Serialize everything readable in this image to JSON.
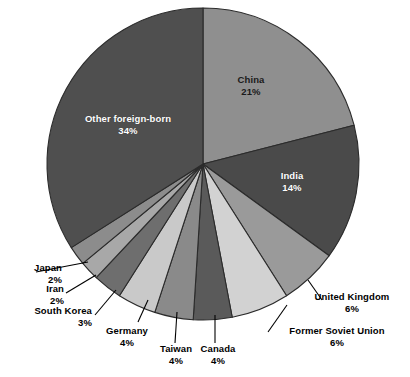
{
  "chart_data": {
    "type": "pie",
    "title": "",
    "subtitle": "",
    "xlabel": "",
    "ylabel": "",
    "legend_position": "none",
    "grid": false,
    "units": "percent",
    "total": 100,
    "start_angle_deg": 0,
    "direction": "clockwise",
    "categories": [
      "China",
      "India",
      "United Kingdom",
      "Former Soviet Union",
      "Canada",
      "Taiwan",
      "Germany",
      "South Korea",
      "Iran",
      "Japan",
      "Other foreign-born"
    ],
    "values": [
      21,
      14,
      6,
      6,
      4,
      4,
      4,
      3,
      2,
      2,
      34
    ],
    "slices": [
      {
        "name": "China",
        "value": 21,
        "pct_label": "21%",
        "color": "#8f8f8f",
        "label_placement": "inside",
        "label_color": "dark"
      },
      {
        "name": "India",
        "value": 14,
        "pct_label": "14%",
        "color": "#4a4a4a",
        "label_placement": "inside",
        "label_color": "light"
      },
      {
        "name": "United Kingdom",
        "value": 6,
        "pct_label": "6%",
        "color": "#9a9a9a",
        "label_placement": "outside-right",
        "label_color": "black"
      },
      {
        "name": "Former Soviet Union",
        "value": 6,
        "pct_label": "6%",
        "color": "#d2d2d2",
        "label_placement": "outside-right",
        "label_color": "black"
      },
      {
        "name": "Canada",
        "value": 4,
        "pct_label": "4%",
        "color": "#5a5a5a",
        "label_placement": "outside-bottom",
        "label_color": "black"
      },
      {
        "name": "Taiwan",
        "value": 4,
        "pct_label": "4%",
        "color": "#8a8a8a",
        "label_placement": "outside-bottom",
        "label_color": "black"
      },
      {
        "name": "Germany",
        "value": 4,
        "pct_label": "4%",
        "color": "#c9c9c9",
        "label_placement": "outside-bottom",
        "label_color": "black"
      },
      {
        "name": "South Korea",
        "value": 3,
        "pct_label": "3%",
        "color": "#6e6e6e",
        "label_placement": "outside-left",
        "label_color": "black"
      },
      {
        "name": "Iran",
        "value": 2,
        "pct_label": "2%",
        "color": "#a8a8a8",
        "label_placement": "outside-left",
        "label_color": "black"
      },
      {
        "name": "Japan",
        "value": 2,
        "pct_label": "2%",
        "color": "#8c8c8c",
        "label_placement": "outside-left",
        "label_color": "black"
      },
      {
        "name": "Other foreign-born",
        "value": 34,
        "pct_label": "34%",
        "color": "#4f4f4f",
        "label_placement": "inside",
        "label_color": "light"
      }
    ]
  },
  "labels": {
    "china": {
      "name": "China",
      "pct": "21%"
    },
    "india": {
      "name": "India",
      "pct": "14%"
    },
    "united_kingdom": {
      "name": "United Kingdom",
      "pct": "6%"
    },
    "former_soviet_union": {
      "name": "Former Soviet Union",
      "pct": "6%"
    },
    "canada": {
      "name": "Canada",
      "pct": "4%"
    },
    "taiwan": {
      "name": "Taiwan",
      "pct": "4%"
    },
    "germany": {
      "name": "Germany",
      "pct": "4%"
    },
    "south_korea": {
      "name": "South Korea",
      "pct": "3%"
    },
    "iran": {
      "name": "Iran",
      "pct": "2%"
    },
    "japan": {
      "name": "Japan",
      "pct": "2%"
    },
    "other": {
      "name": "Other foreign-born",
      "pct": "34%"
    }
  },
  "geometry": {
    "center_x": 203,
    "center_y": 164,
    "radius": 156
  },
  "colors": {
    "background": "#ffffff",
    "outline": "#2b2b2b",
    "leader_line": "#000000",
    "text_dark": "#000000",
    "text_light": "#ffffff"
  }
}
